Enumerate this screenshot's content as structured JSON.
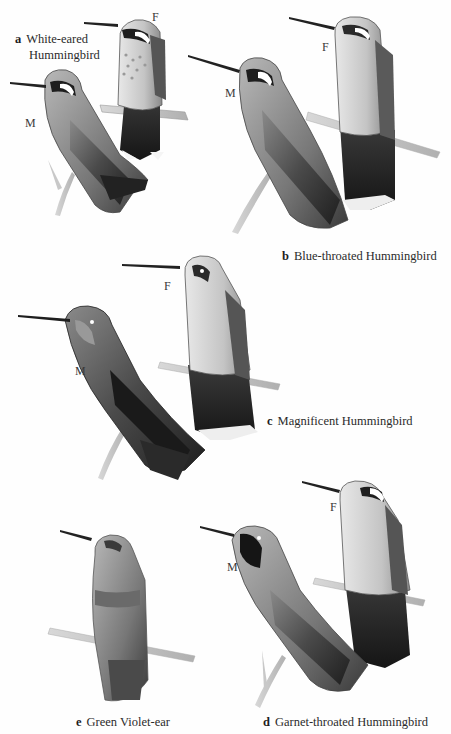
{
  "plate": {
    "background": "#fefefe",
    "ink_color": "#2b2b2b",
    "top_fragment": "",
    "species": [
      {
        "letter": "a",
        "name_line1": "White-eared",
        "name_line2": "Hummingbird",
        "sexes": {
          "male": "M",
          "female": "F"
        }
      },
      {
        "letter": "b",
        "name": "Blue-throated Hummingbird",
        "sexes": {
          "male": "M",
          "female": "F"
        }
      },
      {
        "letter": "c",
        "name": "Magnificent Hummingbird",
        "sexes": {
          "male": "M",
          "female": "F"
        }
      },
      {
        "letter": "d",
        "name": "Garnet-throated Hummingbird",
        "sexes": {
          "male": "M",
          "female": "F"
        }
      },
      {
        "letter": "e",
        "name": "Green Violet-ear"
      }
    ],
    "icons": {
      "bird": "hummingbird-illustration",
      "perch": "branch-illustration"
    }
  }
}
